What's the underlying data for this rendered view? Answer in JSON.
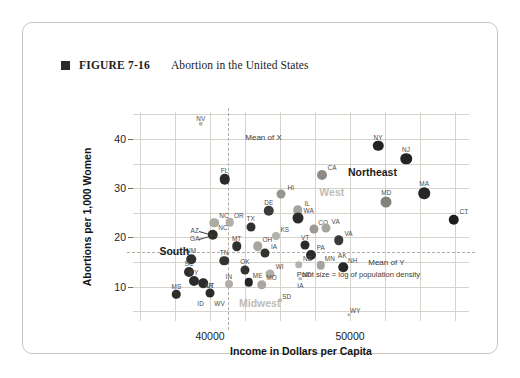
{
  "figure": {
    "marker_icon": "filled-square-bullet",
    "number": "FIGURE 7-16",
    "title": "Abortion in the United States"
  },
  "chart_data": {
    "type": "scatter",
    "title": "Abortion in the United States",
    "xlabel": "Income in Dollars per Capita",
    "ylabel": "Abortions per 1,000 Women",
    "xlim": [
      34500,
      58500
    ],
    "ylim": [
      3.0,
      45.5
    ],
    "xticks": [
      40000,
      50000
    ],
    "yticks": [
      10,
      20,
      30,
      40
    ],
    "grid": true,
    "legend": "none",
    "size_encoding": "Point size = log of population density",
    "color_encoding": "grayscale shade by region",
    "annotations": [
      {
        "name": "mean-of-x",
        "text": "Mean of X",
        "orientation": "vertical-dashed",
        "x": 41250
      },
      {
        "name": "mean-of-y",
        "text": "Mean of Y",
        "orientation": "horizontal-dashed",
        "y": 17.0
      },
      {
        "name": "point-size-note",
        "text": "Point size = log of population density",
        "x": 50600,
        "y": 12.6
      }
    ],
    "region_labels": [
      {
        "label": "Northeast",
        "x": 51600,
        "y": 33.2,
        "shade": "dark"
      },
      {
        "label": "West",
        "x": 48700,
        "y": 29.3,
        "shade": "light"
      },
      {
        "label": "South",
        "x": 37450,
        "y": 17.2,
        "shade": "dark"
      },
      {
        "label": "Midwest",
        "x": 43550,
        "y": 6.7,
        "shade": "light"
      }
    ],
    "points": [
      {
        "label": "NV",
        "x": 39350,
        "y": 43.1,
        "size": 4.5,
        "shade": "#b9b6b0"
      },
      {
        "label": "NY",
        "x": 52000,
        "y": 38.6,
        "size": 10.5,
        "shade": "#232323"
      },
      {
        "label": "NJ",
        "x": 54000,
        "y": 36.0,
        "size": 11.5,
        "shade": "#232323"
      },
      {
        "label": "CA",
        "x": 48000,
        "y": 32.6,
        "size": 10.0,
        "shade": "#8e8b85"
      },
      {
        "label": "FL",
        "x": 41050,
        "y": 31.8,
        "size": 10.5,
        "shade": "#2a2a2a"
      },
      {
        "label": "MA",
        "x": 55300,
        "y": 29.0,
        "size": 11.5,
        "shade": "#262626"
      },
      {
        "label": "HI",
        "x": 45100,
        "y": 28.8,
        "size": 9.0,
        "shade": "#979490"
      },
      {
        "label": "MD",
        "x": 52600,
        "y": 27.3,
        "size": 11.0,
        "shade": "#85827c"
      },
      {
        "label": "DE",
        "x": 44200,
        "y": 25.4,
        "size": 10.5,
        "shade": "#3a3a38"
      },
      {
        "label": "IL",
        "x": 46250,
        "y": 25.5,
        "size": 9.5,
        "shade": "#a6a39d"
      },
      {
        "label": "CT",
        "x": 57400,
        "y": 23.6,
        "size": 10.5,
        "shade": "#1e1e1e"
      },
      {
        "label": "WA",
        "x": 46300,
        "y": 23.9,
        "size": 11.0,
        "shade": "#2b2b2b"
      },
      {
        "label": "NC",
        "x": 40300,
        "y": 23.0,
        "size": 9.5,
        "shade": "#aeaba5"
      },
      {
        "label": "OR",
        "x": 41400,
        "y": 23.1,
        "size": 8.5,
        "shade": "#b2afa9"
      },
      {
        "label": "TX",
        "x": 42900,
        "y": 22.2,
        "size": 9.0,
        "shade": "#303030"
      },
      {
        "label": "CO",
        "x": 47400,
        "y": 21.7,
        "size": 9.0,
        "shade": "#9c9993"
      },
      {
        "label": "VA",
        "x": 48300,
        "y": 21.9,
        "size": 9.0,
        "shade": "#a8a59f"
      },
      {
        "label": "NC",
        "x": 40200,
        "y": 20.5,
        "size": 10.5,
        "shade": "#2e2e2c"
      },
      {
        "label": "AZ",
        "x": 40200,
        "y": 20.5,
        "size": 0,
        "shade": "none"
      },
      {
        "label": "GA",
        "x": 40200,
        "y": 20.5,
        "size": 0,
        "shade": "none"
      },
      {
        "label": "KS",
        "x": 44700,
        "y": 20.2,
        "size": 8.0,
        "shade": "#b4b1ab"
      },
      {
        "label": "VA",
        "x": 49200,
        "y": 19.4,
        "size": 9.5,
        "shade": "#3a3a38"
      },
      {
        "label": "MT",
        "x": 41900,
        "y": 18.2,
        "size": 9.5,
        "shade": "#2f2f2d"
      },
      {
        "label": "OH",
        "x": 43400,
        "y": 18.2,
        "size": 9.5,
        "shade": "#a9a6a0"
      },
      {
        "label": "VT",
        "x": 46800,
        "y": 18.4,
        "size": 9.0,
        "shade": "#2b2b2b"
      },
      {
        "label": "IA",
        "x": 43900,
        "y": 16.8,
        "size": 9.0,
        "shade": "#333331"
      },
      {
        "label": "PA",
        "x": 47200,
        "y": 16.5,
        "size": 10.0,
        "shade": "#2b2b2b"
      },
      {
        "label": "AK",
        "x": 49100,
        "y": 16.5,
        "size": 0,
        "shade": "none"
      },
      {
        "label": "NM",
        "x": 38650,
        "y": 15.6,
        "size": 9.5,
        "shade": "#2f2f2d"
      },
      {
        "label": "TN",
        "x": 41000,
        "y": 15.3,
        "size": 9.5,
        "shade": "#333331"
      },
      {
        "label": "NE",
        "x": 46350,
        "y": 14.4,
        "size": 7.5,
        "shade": "#b4b1ab"
      },
      {
        "label": "MN",
        "x": 47900,
        "y": 14.3,
        "size": 8.5,
        "shade": "#a7a49e"
      },
      {
        "label": "NH",
        "x": 49500,
        "y": 13.9,
        "size": 9.5,
        "shade": "#272727"
      },
      {
        "label": "SC",
        "x": 38500,
        "y": 13.0,
        "size": 10.0,
        "shade": "#2e2e2c"
      },
      {
        "label": "OK",
        "x": 42500,
        "y": 13.4,
        "size": 9.0,
        "shade": "#333331"
      },
      {
        "label": "WI",
        "x": 44300,
        "y": 12.6,
        "size": 9.0,
        "shade": "#b0ada7"
      },
      {
        "label": "KY",
        "x": 38850,
        "y": 11.2,
        "size": 10.0,
        "shade": "#2b2b2b"
      },
      {
        "label": "AR",
        "x": 39500,
        "y": 10.7,
        "size": 9.5,
        "shade": "#2b2b2b"
      },
      {
        "label": "IN",
        "x": 41350,
        "y": 10.6,
        "size": 8.0,
        "shade": "#b1aea8"
      },
      {
        "label": "ME",
        "x": 42750,
        "y": 10.9,
        "size": 8.5,
        "shade": "#252525"
      },
      {
        "label": "MO",
        "x": 43700,
        "y": 10.4,
        "size": 9.5,
        "shade": "#a9a6a0"
      },
      {
        "label": "IA",
        "x": 46100,
        "y": 10.4,
        "size": 0,
        "shade": "none"
      },
      {
        "label": "UT",
        "x": 40000,
        "y": 8.6,
        "size": 9.0,
        "shade": "#2b2b2b"
      },
      {
        "label": "MS",
        "x": 37600,
        "y": 8.4,
        "size": 8.5,
        "shade": "#2d2d2b"
      },
      {
        "label": "ID",
        "x": 38900,
        "y": 7.0,
        "size": 0,
        "shade": "none"
      },
      {
        "label": "WV",
        "x": 40250,
        "y": 7.0,
        "size": 0,
        "shade": "none"
      },
      {
        "label": "SD",
        "x": 45000,
        "y": 7.2,
        "size": 3.5,
        "shade": "#bdbab4"
      },
      {
        "label": "ND",
        "x": 46450,
        "y": 11.6,
        "size": 3.5,
        "shade": "#bdbab4"
      },
      {
        "label": "WY",
        "x": 49900,
        "y": 4.3,
        "size": 3.5,
        "shade": "#bdbab4"
      }
    ]
  }
}
